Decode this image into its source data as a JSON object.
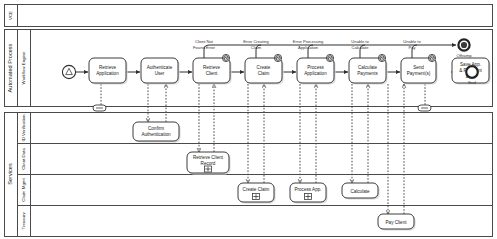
{
  "diagram": {
    "type": "bpmn-process-diagram"
  },
  "pools": [
    {
      "id": "vce",
      "label": "VCE",
      "lanes": []
    },
    {
      "id": "automated",
      "label": "Automated Process",
      "lanes": [
        {
          "id": "workflow-engine",
          "label": "Workflow Engine"
        }
      ]
    },
    {
      "id": "services",
      "label": "Services",
      "lanes": [
        {
          "id": "id-verification",
          "label": "ID Verification"
        },
        {
          "id": "client-data",
          "label": "Client Data"
        },
        {
          "id": "claim-mgmt",
          "label": "Claim Mgmt"
        },
        {
          "id": "treasury",
          "label": "Treasury"
        }
      ]
    }
  ],
  "events": {
    "start": {
      "label": "",
      "type": "signal-start"
    },
    "end": {
      "label": "End",
      "type": "end"
    },
    "offramp": {
      "label": "Offramp",
      "type": "terminate-end"
    }
  },
  "tasks": [
    {
      "id": "retrieve-application",
      "label_1": "Retrieve",
      "label_2": "Application",
      "lane": "workflow-engine"
    },
    {
      "id": "authenticate-user",
      "label_1": "Authenticate",
      "label_2": "User",
      "lane": "workflow-engine"
    },
    {
      "id": "retrieve-client",
      "label_1": "Retrieve",
      "label_2": "Client",
      "lane": "workflow-engine"
    },
    {
      "id": "create-claim",
      "label_1": "Create",
      "label_2": "Claim",
      "lane": "workflow-engine"
    },
    {
      "id": "process-application",
      "label_1": "Process",
      "label_2": "Application",
      "lane": "workflow-engine"
    },
    {
      "id": "calculate-payments",
      "label_1": "Calculate",
      "label_2": "Payments",
      "lane": "workflow-engine"
    },
    {
      "id": "send-payments",
      "label_1": "Send",
      "label_2": "Payment(s)",
      "lane": "workflow-engine"
    },
    {
      "id": "save-app-payment-data",
      "label_1": "Save App.",
      "label_2": "& Payment",
      "label_3": "Data",
      "lane": "workflow-engine"
    }
  ],
  "service_tasks": [
    {
      "id": "confirm-authentication",
      "label_1": "Confirm",
      "label_2": "Authentication",
      "lane": "id-verification",
      "marker": "none"
    },
    {
      "id": "retrieve-client-record",
      "label_1": "Retrieve Client",
      "label_2": "Record",
      "lane": "client-data",
      "marker": "subprocess"
    },
    {
      "id": "create-claim-service",
      "label_1": "Create Claim",
      "label_2": "",
      "lane": "claim-mgmt",
      "marker": "subprocess"
    },
    {
      "id": "process-app-service",
      "label_1": "Process App.",
      "label_2": "",
      "lane": "claim-mgmt",
      "marker": "subprocess"
    },
    {
      "id": "calculate-service",
      "label_1": "Calculate",
      "label_2": "",
      "lane": "claim-mgmt",
      "marker": "none"
    },
    {
      "id": "pay-client-service",
      "label_1": "Pay Client",
      "label_2": "",
      "lane": "treasury",
      "marker": "none"
    }
  ],
  "boundary_errors": [
    {
      "id": "client-not-found-error",
      "attached_to": "retrieve-client",
      "label_1": "Client Not",
      "label_2": "Found Error"
    },
    {
      "id": "error-creating-claim",
      "attached_to": "create-claim",
      "label_1": "Error Creating",
      "label_2": "Claim"
    },
    {
      "id": "error-processing-application",
      "attached_to": "process-application",
      "label_1": "Error Processing",
      "label_2": "Application"
    },
    {
      "id": "unable-to-calculate",
      "attached_to": "calculate-payments",
      "label_1": "Unable to",
      "label_2": "Calculate"
    },
    {
      "id": "unable-to-pay",
      "attached_to": "send-payments",
      "label_1": "Unable to",
      "label_2": "Pay"
    }
  ],
  "colors": {
    "stroke": "#3c3c3c",
    "background": "#ffffff",
    "shadow": "#d9d9d9"
  }
}
